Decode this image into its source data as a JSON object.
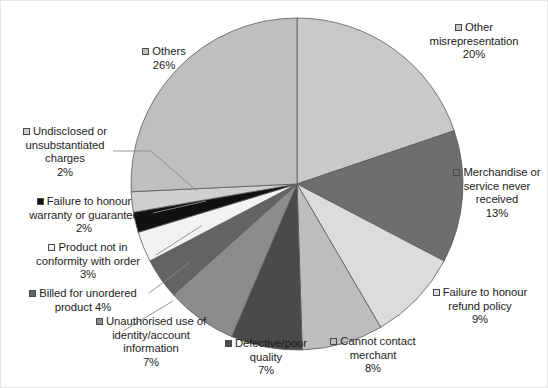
{
  "chart_data": {
    "type": "pie",
    "title": "",
    "start_angle_deg": 0,
    "direction": "clockwise",
    "legend": "callout-labels",
    "grid": false,
    "categories": [
      "Other misrepresentation",
      "Merchandise or service never received",
      "Failure to honour refund policy",
      "Cannot contact merchant",
      "Defective/poor quality",
      "Unauthorised use of identity/account information",
      "Billed for unordered product",
      "Product not in conformity with order",
      "Failure to honour warranty or guarantee",
      "Undisclosed or unsubstantiated charges",
      "Others"
    ],
    "values": [
      20,
      13,
      9,
      8,
      7,
      7,
      4,
      3,
      2,
      2,
      26
    ],
    "unit": "%",
    "colors": [
      "#c9c9c9",
      "#6e6e6e",
      "#dcdcdc",
      "#bdbdbd",
      "#4a4a4a",
      "#8c8c8c",
      "#636363",
      "#f2f2f2",
      "#111111",
      "#cfcfcf",
      "#bfbfbf"
    ]
  },
  "labels": [
    {
      "id": "other-misrepresentation",
      "swatch": "#c9c9c9",
      "lines": [
        "Other",
        "misrepresentation",
        "20%"
      ]
    },
    {
      "id": "merchandise-never-received",
      "swatch": "#6e6e6e",
      "lines": [
        "Merchandise or",
        "service never",
        "received",
        "13%"
      ]
    },
    {
      "id": "failure-refund-policy",
      "swatch": "#dcdcdc",
      "lines": [
        "Failure to honour",
        "refund policy",
        "9%"
      ]
    },
    {
      "id": "cannot-contact-merchant",
      "swatch": "#bdbdbd",
      "lines": [
        "Cannot contact",
        "merchant",
        "8%"
      ]
    },
    {
      "id": "defective-poor-quality",
      "swatch": "#4a4a4a",
      "lines": [
        "Defective/poor",
        "quality",
        "7%"
      ]
    },
    {
      "id": "unauthorised-use-identity",
      "swatch": "#8c8c8c",
      "lines": [
        "Unauthorised use of",
        "identity/account",
        "information",
        "7%"
      ]
    },
    {
      "id": "billed-unordered-product",
      "swatch": "#636363",
      "lines": [
        "Billed for unordered",
        "product 4%"
      ]
    },
    {
      "id": "product-not-in-conformity",
      "swatch": "#f2f2f2",
      "lines": [
        "Product not in",
        "conformity with order",
        "3%"
      ]
    },
    {
      "id": "failure-warranty-guarantee",
      "swatch": "#111111",
      "lines": [
        "Failure to honour",
        "warranty or guarantee",
        "2%"
      ]
    },
    {
      "id": "undisclosed-charges",
      "swatch": "#cfcfcf",
      "lines": [
        "Undisclosed or",
        "unsubstantiated",
        "charges",
        "2%"
      ]
    },
    {
      "id": "others",
      "swatch": "#bfbfbf",
      "lines": [
        "Others",
        "26%"
      ]
    }
  ]
}
